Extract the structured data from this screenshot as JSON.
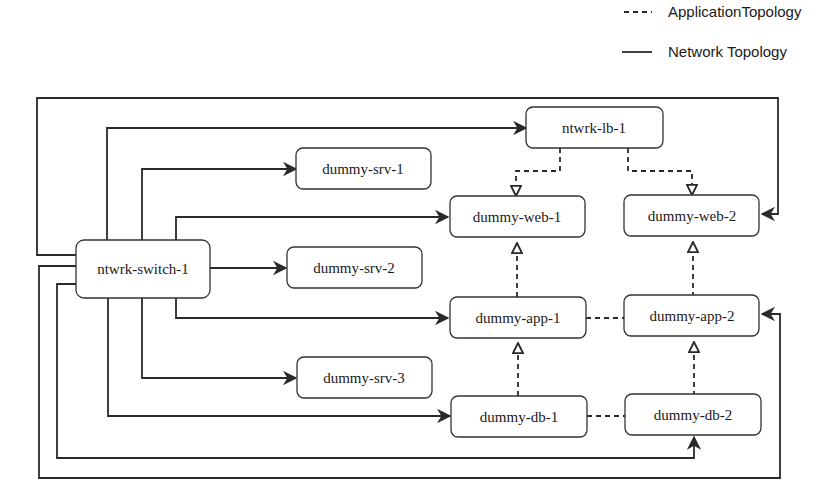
{
  "legend": {
    "items": [
      {
        "style": "dashed",
        "label": "ApplicationTopology"
      },
      {
        "style": "solid",
        "label": "Network Topology"
      }
    ]
  },
  "nodes": {
    "switch": {
      "label": "ntwrk-switch-1"
    },
    "lb": {
      "label": "ntwrk-lb-1"
    },
    "srv1": {
      "label": "dummy-srv-1"
    },
    "srv2": {
      "label": "dummy-srv-2"
    },
    "srv3": {
      "label": "dummy-srv-3"
    },
    "web1": {
      "label": "dummy-web-1"
    },
    "web2": {
      "label": "dummy-web-2"
    },
    "app1": {
      "label": "dummy-app-1"
    },
    "app2": {
      "label": "dummy-app-2"
    },
    "db1": {
      "label": "dummy-db-1"
    },
    "db2": {
      "label": "dummy-db-2"
    }
  },
  "edges": {
    "network": [
      [
        "ntwrk-switch-1",
        "ntwrk-lb-1"
      ],
      [
        "ntwrk-switch-1",
        "dummy-web-2"
      ],
      [
        "ntwrk-switch-1",
        "dummy-srv-1"
      ],
      [
        "ntwrk-switch-1",
        "dummy-web-1"
      ],
      [
        "ntwrk-switch-1",
        "dummy-srv-2"
      ],
      [
        "ntwrk-switch-1",
        "dummy-app-1"
      ],
      [
        "ntwrk-switch-1",
        "dummy-srv-3"
      ],
      [
        "ntwrk-switch-1",
        "dummy-db-1"
      ],
      [
        "ntwrk-switch-1",
        "dummy-db-2"
      ],
      [
        "ntwrk-switch-1",
        "dummy-app-2"
      ]
    ],
    "application": [
      [
        "ntwrk-lb-1",
        "dummy-web-1"
      ],
      [
        "ntwrk-lb-1",
        "dummy-web-2"
      ],
      [
        "dummy-app-1",
        "dummy-web-1"
      ],
      [
        "dummy-app-2",
        "dummy-web-2"
      ],
      [
        "dummy-db-1",
        "dummy-app-1"
      ],
      [
        "dummy-db-2",
        "dummy-app-2"
      ],
      [
        "dummy-app-1",
        "dummy-app-2"
      ],
      [
        "dummy-db-1",
        "dummy-db-2"
      ]
    ]
  }
}
